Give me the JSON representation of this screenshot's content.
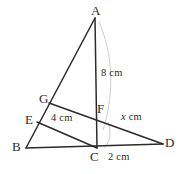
{
  "figure": {
    "stroke_color": "#2b2b2b",
    "arc_color": "#cfcfcf",
    "background": "#ffffff",
    "points": [
      {
        "name": "A",
        "label": "A",
        "x": 95,
        "y": 18,
        "label_x": 91,
        "label_y": 4
      },
      {
        "name": "B",
        "label": "B",
        "x": 26,
        "y": 148,
        "label_x": 12,
        "label_y": 140
      },
      {
        "name": "C",
        "label": "C",
        "x": 97,
        "y": 148,
        "label_x": 90,
        "label_y": 150
      },
      {
        "name": "D",
        "label": "D",
        "x": 163,
        "y": 144,
        "label_x": 165,
        "label_y": 136
      },
      {
        "name": "E",
        "label": "E",
        "x": 37,
        "y": 122,
        "label_x": 25,
        "label_y": 113
      },
      {
        "name": "F",
        "label": "F",
        "x": 97,
        "y": 115,
        "label_x": 97,
        "label_y": 102
      },
      {
        "name": "G",
        "label": "G",
        "x": 49,
        "y": 103,
        "label_x": 39,
        "label_y": 92
      }
    ],
    "segments": [
      {
        "name": "segment-AB",
        "from": "A",
        "to": "B"
      },
      {
        "name": "segment-AC",
        "from": "A",
        "to": "C"
      },
      {
        "name": "segment-BD",
        "from": "B",
        "to": "D"
      },
      {
        "name": "segment-GD",
        "from": "G",
        "to": "D"
      },
      {
        "name": "segment-EC",
        "from": "E",
        "to": "C"
      }
    ],
    "arcs": [
      {
        "name": "arc-AC-right",
        "d": "M 99 22 C 115 58, 113 100, 103 130"
      },
      {
        "name": "arc-C-corner",
        "d": "M 108 122 C 112 133, 110 142, 104 148"
      }
    ],
    "measurements": [
      {
        "name": "measure-AC",
        "value": "8",
        "unit": "cm",
        "text": "8 cm",
        "x": 101,
        "y": 68,
        "italic_var": false
      },
      {
        "name": "measure-GF",
        "value": "4",
        "unit": "cm",
        "text": "4 cm",
        "x": 51,
        "y": 113,
        "italic_var": false
      },
      {
        "name": "measure-FD",
        "value": "x",
        "unit": "cm",
        "text": "x cm",
        "x": 121,
        "y": 112,
        "italic_var": true
      },
      {
        "name": "measure-CD",
        "value": "2",
        "unit": "cm",
        "text": "2 cm",
        "x": 108,
        "y": 152,
        "italic_var": false
      }
    ]
  }
}
